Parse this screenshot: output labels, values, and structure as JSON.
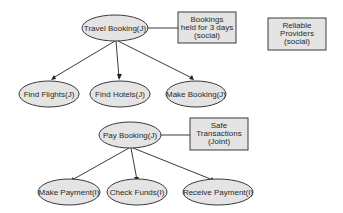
{
  "diagram": {
    "groups": [
      {
        "root": {
          "label": "Travel Booking(J)"
        },
        "note": {
          "lines": [
            "Bookings",
            "held for 3 days",
            "(social)"
          ]
        },
        "children": [
          {
            "label": "Find Flights(J)"
          },
          {
            "label": "Find Hotels(J)"
          },
          {
            "label": "Make Booking(J)"
          }
        ]
      },
      {
        "root": {
          "label": "Pay Booking(J)"
        },
        "note": {
          "lines": [
            "Safe",
            "Transactions",
            "(Joint)"
          ]
        },
        "children": [
          {
            "label": "Make Payment(I)"
          },
          {
            "label": "Check Funds(I)"
          },
          {
            "label": "Receive Payment(I)"
          }
        ]
      }
    ],
    "standalone_note": {
      "lines": [
        "Reliable",
        "Providers",
        "(social)"
      ]
    }
  }
}
